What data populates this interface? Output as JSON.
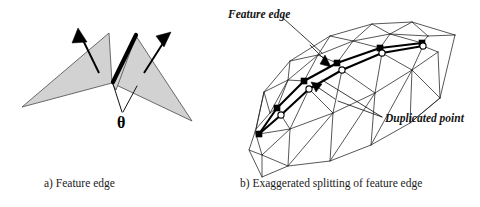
{
  "figure": {
    "background_color": "#ffffff",
    "ink_color": "#1a1a1a",
    "face_fill_color": "#d2d2d2",
    "face_stroke_color": "#5a5a5a"
  },
  "panel_a": {
    "caption": "a) Feature edge",
    "angle_symbol": "θ",
    "angle_symbol_name": "theta",
    "normal_arrow_count": 2,
    "feature_edge_description": "bold black edge shared by two shaded triangles"
  },
  "panel_b": {
    "caption": "b) Exaggerated splitting of feature edge",
    "label_feature_edge": "Feature edge",
    "label_duplicated_point": "Duplicated point",
    "filled_node_count": 5,
    "open_node_count": 4
  }
}
